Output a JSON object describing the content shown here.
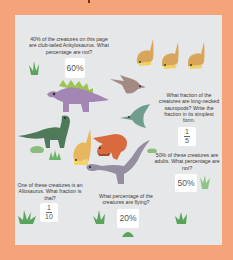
{
  "colors": {
    "page_background": "#f4a478",
    "panel_background": "#e6e7e8",
    "answer_box": "#ffffff",
    "text": "#3a3a3a",
    "grass": "#5aa35a"
  },
  "questions": [
    {
      "id": "ankylosaurus",
      "text": "40% of the creatures on this page are club-tailed Ankylosaurus. What percentage are not?",
      "answer": "60%"
    },
    {
      "id": "sauropods",
      "text": "What fraction of the creatures are long-necked sauropods? Write the fraction in its simplest form.",
      "answer": {
        "numerator": "1",
        "denominator": "5"
      }
    },
    {
      "id": "adults",
      "text": "50% of these creatures are adults. What percentage are not?",
      "answer": "50%"
    },
    {
      "id": "allosaurus",
      "text": "One of these creatures is an Allosaurus. What fraction is that?",
      "answer": {
        "numerator": "1",
        "denominator": "10"
      }
    },
    {
      "id": "flying",
      "text": "What percentage of the creatures are flying?",
      "answer": "20%"
    }
  ],
  "icons": {
    "ankylosaurus": "ankylosaurus-icon",
    "stegosaurus": "stegosaurus-icon",
    "pterodactyl": "pterodactyl-icon",
    "sauropod": "sauropod-icon",
    "allosaurus": "allosaurus-icon",
    "grass": "grass-icon"
  }
}
